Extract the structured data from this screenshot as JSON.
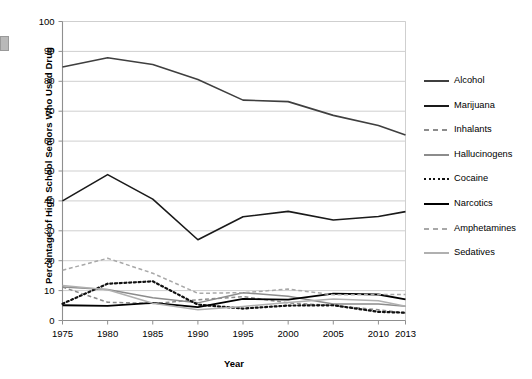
{
  "chart_data": {
    "type": "line",
    "title": "",
    "xlabel": "Year",
    "ylabel": "Percentage of High School Seniors Who Used Drug",
    "categories": [
      "1975",
      "1980",
      "1985",
      "1990",
      "1995",
      "2000",
      "2005",
      "2010",
      "2013"
    ],
    "x": [
      1975,
      1980,
      1985,
      1990,
      1995,
      2000,
      2005,
      2010,
      2013
    ],
    "xlim": [
      1975,
      2013
    ],
    "ylim": [
      0,
      100
    ],
    "yticks": [
      "0",
      "10",
      "20",
      "30",
      "40",
      "50",
      "60",
      "70",
      "80",
      "90",
      "100"
    ],
    "ytick_values": [
      0,
      10,
      20,
      30,
      40,
      50,
      60,
      70,
      80,
      90,
      100
    ],
    "grid": "horizontal",
    "legend_position": "right",
    "series": [
      {
        "name": "Alcohol",
        "style": "solid",
        "color": "#3f3f3f",
        "width": 1.6,
        "values": [
          84.8,
          87.9,
          85.6,
          80.6,
          73.7,
          73.2,
          68.6,
          65.2,
          62.0
        ]
      },
      {
        "name": "Marijuana",
        "style": "solid",
        "color": "#1a1a1a",
        "width": 1.6,
        "values": [
          40.0,
          48.8,
          40.6,
          27.0,
          34.7,
          36.5,
          33.6,
          34.8,
          36.4
        ]
      },
      {
        "name": "Inhalants",
        "style": "dashed",
        "color": "#8c8c8c",
        "width": 1.5,
        "values": [
          11.2,
          6.1,
          5.7,
          6.9,
          8.0,
          5.9,
          5.0,
          3.6,
          2.5
        ]
      },
      {
        "name": "Hallucinogens",
        "style": "solid",
        "color": "#8c8c8c",
        "width": 1.5,
        "values": [
          11.2,
          10.4,
          7.6,
          5.9,
          9.3,
          8.1,
          5.5,
          5.5,
          4.8
        ]
      },
      {
        "name": "Cocaine",
        "style": "dotted",
        "color": "#111111",
        "width": 2.2,
        "values": [
          5.6,
          12.3,
          13.1,
          5.3,
          4.0,
          5.0,
          5.1,
          2.9,
          2.6
        ]
      },
      {
        "name": "Narcotics",
        "style": "solid",
        "color": "#000000",
        "width": 1.8,
        "values": [
          5.1,
          4.9,
          5.9,
          4.5,
          7.2,
          7.0,
          9.0,
          8.7,
          7.1
        ]
      },
      {
        "name": "Amphetamines",
        "style": "dashed",
        "color": "#a8a8a8",
        "width": 1.5,
        "values": [
          16.8,
          20.8,
          15.8,
          9.1,
          9.3,
          10.5,
          8.6,
          8.7,
          8.7
        ]
      },
      {
        "name": "Sedatives",
        "style": "solid",
        "color": "#b0b0b0",
        "width": 1.5,
        "values": [
          11.7,
          10.3,
          5.8,
          3.6,
          4.7,
          6.0,
          7.2,
          6.6,
          4.8
        ]
      }
    ]
  },
  "axes": {
    "y_title": "Percentage of High School Seniors Who Used Drug",
    "x_title": "Year"
  },
  "legend": {
    "items": [
      {
        "label": "Alcohol"
      },
      {
        "label": "Marijuana"
      },
      {
        "label": "Inhalants"
      },
      {
        "label": "Hallucinogens"
      },
      {
        "label": "Cocaine"
      },
      {
        "label": "Narcotics"
      },
      {
        "label": "Amphetamines"
      },
      {
        "label": "Sedatives"
      }
    ]
  },
  "colors": {
    "plot_border": "#b5b5b5",
    "gridline": "#cfcfcf",
    "axis_text": "#000000",
    "background": "#ffffff"
  }
}
